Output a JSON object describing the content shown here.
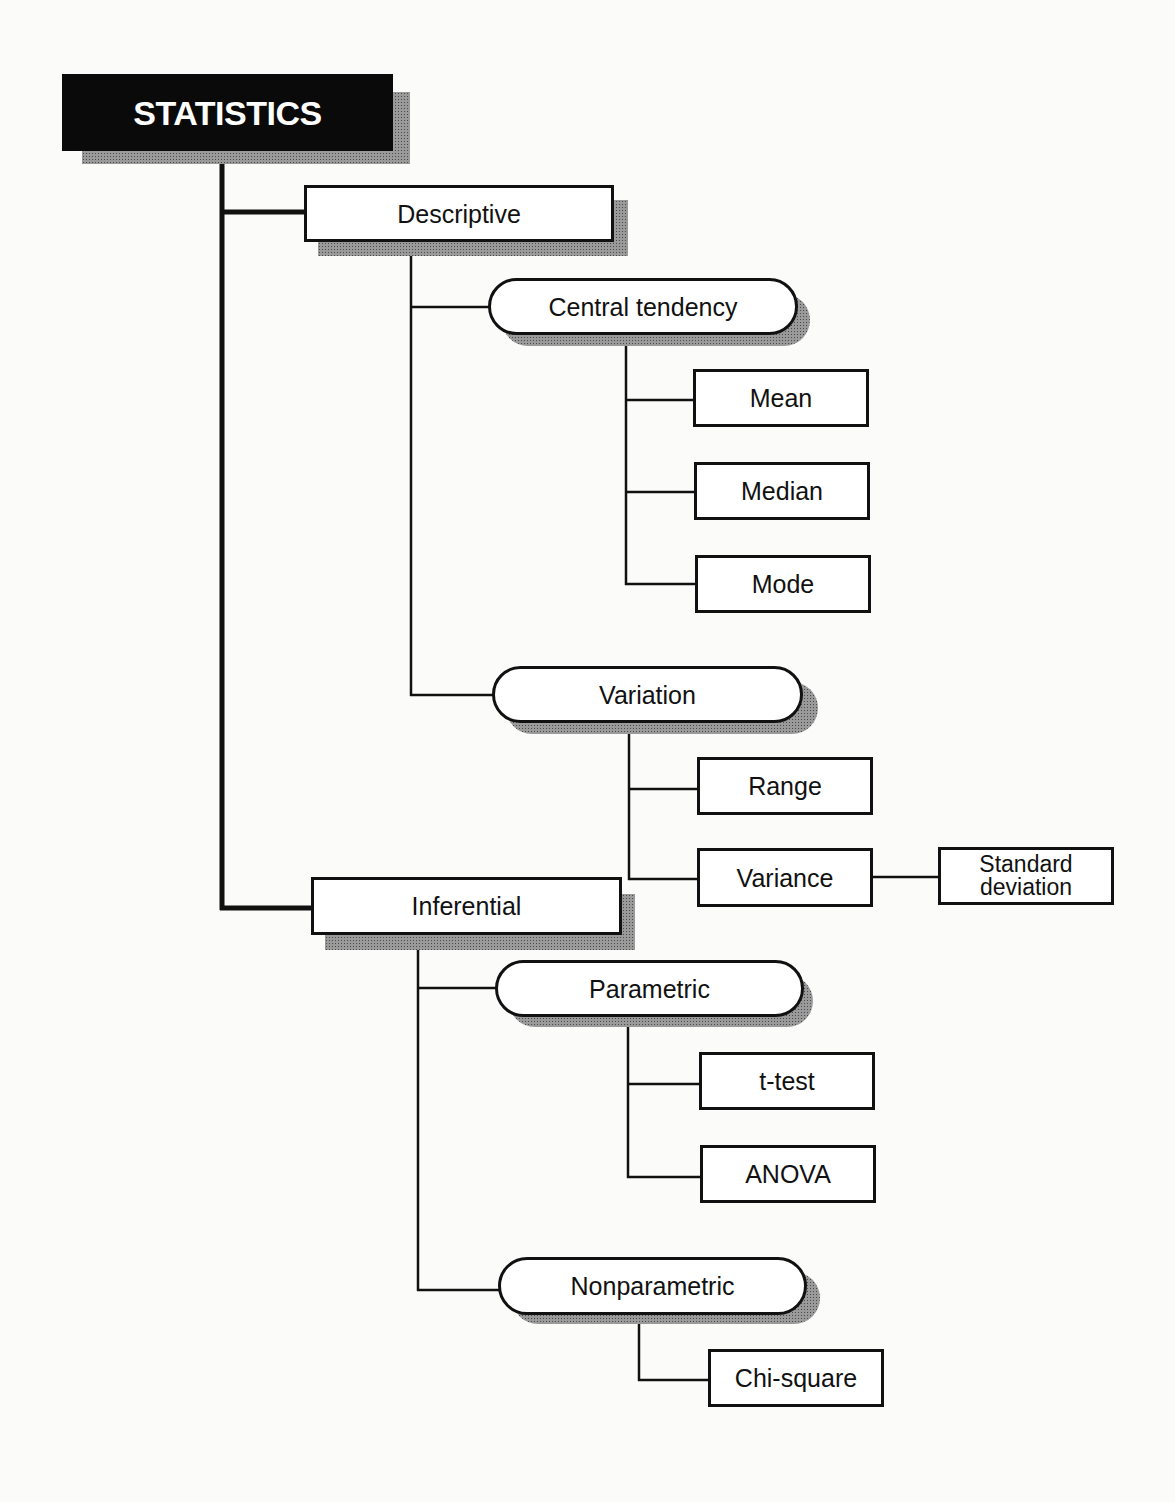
{
  "diagram": {
    "title": "STATISTICS",
    "nodes": {
      "statistics": "STATISTICS",
      "descriptive": "Descriptive",
      "central_tendency": "Central tendency",
      "mean": "Mean",
      "median": "Median",
      "mode": "Mode",
      "variation": "Variation",
      "range": "Range",
      "variance": "Variance",
      "standard_deviation_line1": "Standard",
      "standard_deviation_line2": "deviation",
      "inferential": "Inferential",
      "parametric": "Parametric",
      "t_test": "t-test",
      "anova": "ANOVA",
      "nonparametric": "Nonparametric",
      "chi_square": "Chi-square"
    },
    "hierarchy": {
      "label": "STATISTICS",
      "children": [
        {
          "label": "Descriptive",
          "children": [
            {
              "label": "Central tendency",
              "children": [
                {
                  "label": "Mean"
                },
                {
                  "label": "Median"
                },
                {
                  "label": "Mode"
                }
              ]
            },
            {
              "label": "Variation",
              "children": [
                {
                  "label": "Range"
                },
                {
                  "label": "Variance",
                  "children": [
                    {
                      "label": "Standard deviation"
                    }
                  ]
                }
              ]
            }
          ]
        },
        {
          "label": "Inferential",
          "children": [
            {
              "label": "Parametric",
              "children": [
                {
                  "label": "t-test"
                },
                {
                  "label": "ANOVA"
                }
              ]
            },
            {
              "label": "Nonparametric",
              "children": [
                {
                  "label": "Chi-square"
                }
              ]
            }
          ]
        }
      ]
    },
    "colors": {
      "ink": "#111111",
      "root_fill": "#0a0a0a",
      "root_text": "#ffffff",
      "shadow": "#9a9a9a",
      "paper": "#fbfbf9"
    }
  }
}
